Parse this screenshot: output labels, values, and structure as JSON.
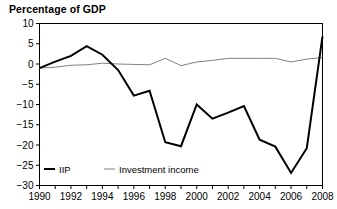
{
  "chart_data": {
    "type": "line",
    "title": "Percentage of GDP",
    "xlabel": "",
    "ylabel": "",
    "xlim": [
      1990,
      2008
    ],
    "ylim": [
      -30,
      10
    ],
    "ytick_step": 5,
    "xtick_step": 1,
    "xtick_label_step": 2,
    "grid": false,
    "legend_position": "bottom-left",
    "yticks": [
      10,
      5,
      0,
      -5,
      -10,
      -15,
      -20,
      -25,
      -30
    ],
    "ytick_labels": [
      "10",
      "5",
      "0",
      "−5",
      "−10",
      "−15",
      "−20",
      "−25",
      "−30"
    ],
    "xticks": [
      1990,
      1991,
      1992,
      1993,
      1994,
      1995,
      1996,
      1997,
      1998,
      1999,
      2000,
      2001,
      2002,
      2003,
      2004,
      2005,
      2006,
      2007,
      2008
    ],
    "xtick_labels": [
      "1990",
      "",
      "1992",
      "",
      "1994",
      "",
      "1996",
      "",
      "1998",
      "",
      "2000",
      "",
      "2002",
      "",
      "2004",
      "",
      "2006",
      "",
      "2008"
    ],
    "x": [
      1990,
      1991,
      1992,
      1993,
      1994,
      1995,
      1996,
      1997,
      1998,
      1999,
      2000,
      2001,
      2002,
      2003,
      2004,
      2005,
      2006,
      2007,
      2008
    ],
    "series": [
      {
        "name": "IIP",
        "color": "#000000",
        "width": 2.0,
        "values": [
          -1.0,
          0.6,
          2.0,
          4.4,
          2.3,
          -1.5,
          -7.8,
          -6.6,
          -19.3,
          -20.3,
          -10.0,
          -13.5,
          -12.0,
          -10.4,
          -18.7,
          -20.4,
          -26.9,
          -20.8,
          6.8
        ]
      },
      {
        "name": "Investment income",
        "color": "#808080",
        "width": 1.0,
        "values": [
          -1.0,
          -0.8,
          -0.3,
          -0.2,
          0.2,
          0.0,
          -0.1,
          -0.2,
          1.4,
          -0.4,
          0.5,
          0.9,
          1.4,
          1.4,
          1.4,
          1.4,
          0.5,
          1.2,
          1.6
        ]
      }
    ]
  },
  "legend": {
    "items": [
      {
        "label": "IIP"
      },
      {
        "label": "Investment income"
      }
    ]
  }
}
